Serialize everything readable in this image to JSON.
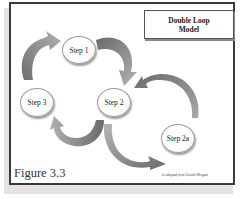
{
  "diagram": {
    "title_line1": "Double Loop",
    "title_line2": "Model",
    "figure_label": "Figure 3.3",
    "credit": "As adapted from Gareth Morgan",
    "nodes": [
      {
        "id": "step1",
        "label": "Step 1"
      },
      {
        "id": "step2",
        "label": "Step 2"
      },
      {
        "id": "step3",
        "label": "Step 3"
      },
      {
        "id": "step2a",
        "label": "Step 2a"
      }
    ],
    "edges": [
      {
        "from": "step3",
        "to": "step1",
        "style": "curved-arrow"
      },
      {
        "from": "step1",
        "to": "step2",
        "style": "curved-arrow"
      },
      {
        "from": "step2",
        "to": "step3",
        "style": "curved-arrow"
      },
      {
        "from": "step2",
        "to": "step2a",
        "style": "curved-arrow"
      },
      {
        "from": "step2a",
        "to": "step2",
        "style": "curved-arrow"
      }
    ],
    "colors": {
      "arrow_dark": "#6f6f6f",
      "arrow_light": "#a8a8a8",
      "frame_border": "#3a3a3a",
      "shadow": "#e3e3e3"
    }
  }
}
